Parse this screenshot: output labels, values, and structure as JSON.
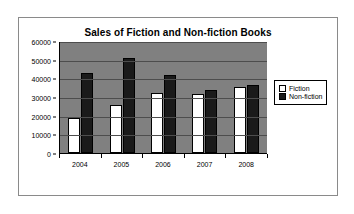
{
  "chart_data": {
    "type": "bar",
    "title": "Sales of Fiction and Non-fiction Books",
    "xlabel": "",
    "ylabel": "",
    "categories": [
      "2004",
      "2005",
      "2006",
      "2007",
      "2008"
    ],
    "series": [
      {
        "name": "Fiction",
        "values": [
          18500,
          25500,
          32000,
          31500,
          35500
        ],
        "color": "#ffffff",
        "swatch": "fiction-swatch"
      },
      {
        "name": "Non-fiction",
        "values": [
          43000,
          51000,
          42000,
          33500,
          36500
        ],
        "color": "#1a1a1a",
        "swatch": "nonfiction-swatch"
      }
    ],
    "ylim": [
      0,
      60000
    ],
    "ytick_values": [
      60000,
      50000,
      40000,
      30000,
      20000,
      10000,
      0
    ],
    "ytick_labels": [
      "60000",
      "50000",
      "40000",
      "30000",
      "20000",
      "10000",
      "0"
    ],
    "grid": true,
    "legend_position": "right",
    "plot_background": "#808080",
    "page_background": "#ffffff",
    "axis_color": "#000000",
    "gridline_color": "#4d4d4d"
  }
}
